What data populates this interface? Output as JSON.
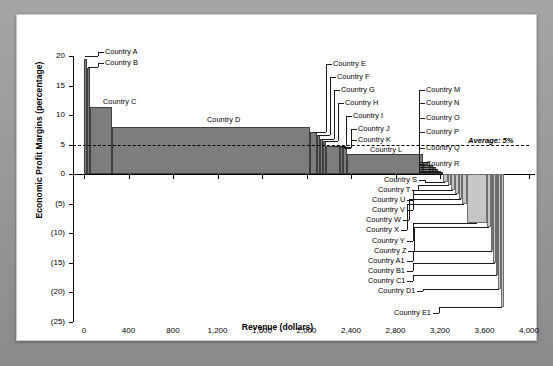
{
  "chart_data": {
    "type": "bar",
    "title": "",
    "xlabel": "Revenue (dollars)",
    "ylabel": "Economic Profit Margins (percentage)",
    "xlim": [
      0,
      4000
    ],
    "ylim": [
      -25,
      20
    ],
    "grid": false,
    "legend": "none",
    "xticks": [
      "0",
      "400",
      "800",
      "1,200",
      "1,600",
      "2,000",
      "2,400",
      "2,800",
      "3,200",
      "3,600",
      "4,000"
    ],
    "xtick_values": [
      0,
      400,
      800,
      1200,
      1600,
      2000,
      2400,
      2800,
      3200,
      3600,
      4000
    ],
    "yticks": [
      "20",
      "15",
      "10",
      "5",
      "0",
      "(5)",
      "(10)",
      "(15)",
      "(20)",
      "(25)"
    ],
    "ytick_values": [
      20,
      15,
      10,
      5,
      0,
      -5,
      -10,
      -15,
      -20,
      -25
    ],
    "annotations": [
      {
        "text": "Average: 5%",
        "value": 5,
        "style": "dashed-line"
      }
    ],
    "note": "Variable-width waterfall of economic profit margin by cumulative revenue",
    "bars": [
      {
        "label": "Country A",
        "x0": 0,
        "x1": 25,
        "value": 19.5
      },
      {
        "label": "Country B",
        "x0": 25,
        "x1": 55,
        "value": 18.0
      },
      {
        "label": "Country C",
        "x0": 55,
        "x1": 250,
        "value": 11.3
      },
      {
        "label": "Country D",
        "x0": 250,
        "x1": 2030,
        "value": 8.0
      },
      {
        "label": "Country E",
        "x0": 2030,
        "x1": 2090,
        "value": 7.2
      },
      {
        "label": "Country F",
        "x0": 2090,
        "x1": 2120,
        "value": 6.6
      },
      {
        "label": "Country G",
        "x0": 2120,
        "x1": 2150,
        "value": 6.0
      },
      {
        "label": "Country H",
        "x0": 2150,
        "x1": 2175,
        "value": 5.6
      },
      {
        "label": "Country I",
        "x0": 2175,
        "x1": 2300,
        "value": 4.8
      },
      {
        "label": "Country J",
        "x0": 2300,
        "x1": 2330,
        "value": 4.6
      },
      {
        "label": "Country K",
        "x0": 2330,
        "x1": 2360,
        "value": 4.4
      },
      {
        "label": "Country L",
        "x0": 2360,
        "x1": 3050,
        "value": 3.5
      },
      {
        "label": "Country M",
        "x0": 3050,
        "x1": 3110,
        "value": 2.0
      },
      {
        "label": "Country N",
        "x0": 3110,
        "x1": 3140,
        "value": 1.6
      },
      {
        "label": "Country O",
        "x0": 3140,
        "x1": 3165,
        "value": 1.2
      },
      {
        "label": "Country P",
        "x0": 3165,
        "x1": 3185,
        "value": 0.9
      },
      {
        "label": "Country Q",
        "x0": 3185,
        "x1": 3205,
        "value": 0.6
      },
      {
        "label": "Country R",
        "x0": 3205,
        "x1": 3225,
        "value": 0.3
      },
      {
        "label": "Country S",
        "x0": 3225,
        "x1": 3270,
        "value": -1.3
      },
      {
        "label": "Country T",
        "x0": 3270,
        "x1": 3300,
        "value": -1.8
      },
      {
        "label": "Country U",
        "x0": 3300,
        "x1": 3335,
        "value": -2.6
      },
      {
        "label": "Country V",
        "x0": 3335,
        "x1": 3370,
        "value": -3.4
      },
      {
        "label": "Country W",
        "x0": 3370,
        "x1": 3400,
        "value": -4.2
      },
      {
        "label": "Country X",
        "x0": 3400,
        "x1": 3440,
        "value": -5.0
      },
      {
        "label": "Country Y",
        "x0": 3440,
        "x1": 3620,
        "value": -8.2
      },
      {
        "label": "Country Z",
        "x0": 3620,
        "x1": 3660,
        "value": -9.0
      },
      {
        "label": "Country A1",
        "x0": 3660,
        "x1": 3680,
        "value": -13.0
      },
      {
        "label": "Country B1",
        "x0": 3680,
        "x1": 3700,
        "value": -15.0
      },
      {
        "label": "Country C1",
        "x0": 3700,
        "x1": 3720,
        "value": -17.0
      },
      {
        "label": "Country D1",
        "x0": 3720,
        "x1": 3745,
        "value": -19.5
      },
      {
        "label": "Country E1",
        "x0": 3745,
        "x1": 3775,
        "value": -22.5
      }
    ]
  },
  "colors": {
    "positive_bar": "#7d7d7d",
    "negative_bar": "#c6c6c6",
    "axis": "#000000",
    "panel_background": "#ffffff",
    "frame_background": "#8e8e8e"
  }
}
